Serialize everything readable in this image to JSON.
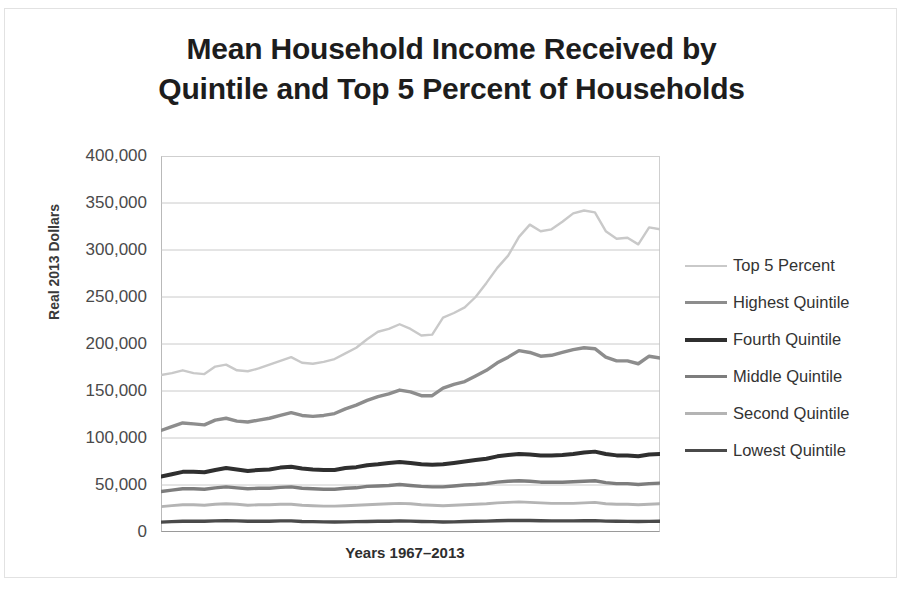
{
  "figure": {
    "title_line1": "Mean Household Income Received by",
    "title_line2": "Quintile and Top 5 Percent of Households",
    "ylabel": "Real 2013 Dollars",
    "xlabel": "Years 1967–2013"
  },
  "axis": {
    "yticks": [
      "400,000",
      "350,000",
      "300,000",
      "250,000",
      "200,000",
      "150,000",
      "100,000",
      "50,000",
      "0"
    ]
  },
  "legend": {
    "items": [
      {
        "label": "Top 5 Percent",
        "color": "#c9c9c9",
        "width": "2.5px"
      },
      {
        "label": "Highest Quintile",
        "color": "#8d8d8d",
        "width": "3.5px"
      },
      {
        "label": "Fourth Quintile",
        "color": "#2f2f2f",
        "width": "4px"
      },
      {
        "label": "Middle Quintile",
        "color": "#7d7d7d",
        "width": "3.5px"
      },
      {
        "label": "Second Quintile",
        "color": "#b4b4b4",
        "width": "3px"
      },
      {
        "label": "Lowest Quintile",
        "color": "#4a4a4a",
        "width": "3.5px"
      }
    ]
  },
  "chart_data": {
    "type": "line",
    "title": "Mean Household Income Received by Quintile and Top 5 Percent of Households",
    "xlabel": "Years 1967–2013",
    "ylabel": "Real 2013 Dollars",
    "ylim": [
      0,
      400000
    ],
    "ytick_step": 50000,
    "grid": true,
    "legend_position": "right",
    "x": [
      1967,
      1968,
      1969,
      1970,
      1971,
      1972,
      1973,
      1974,
      1975,
      1976,
      1977,
      1978,
      1979,
      1980,
      1981,
      1982,
      1983,
      1984,
      1985,
      1986,
      1987,
      1988,
      1989,
      1990,
      1991,
      1992,
      1993,
      1994,
      1995,
      1996,
      1997,
      1998,
      1999,
      2000,
      2001,
      2002,
      2003,
      2004,
      2005,
      2006,
      2007,
      2008,
      2009,
      2010,
      2011,
      2012,
      2013
    ],
    "series": [
      {
        "name": "Top 5 Percent",
        "color": "#c9c9c9",
        "values": [
          167000,
          169000,
          172000,
          169000,
          168000,
          176000,
          178000,
          172000,
          171000,
          174000,
          178000,
          182000,
          186000,
          180000,
          179000,
          181000,
          184000,
          190000,
          196000,
          205000,
          213000,
          216000,
          221000,
          216000,
          209000,
          210000,
          228000,
          233000,
          239000,
          250000,
          265000,
          281000,
          294000,
          314000,
          327000,
          320000,
          322000,
          330000,
          339000,
          342000,
          340000,
          320000,
          312000,
          313000,
          306000,
          324000,
          322000
        ]
      },
      {
        "name": "Highest Quintile",
        "color": "#8d8d8d",
        "values": [
          108000,
          112000,
          116000,
          115000,
          114000,
          119000,
          121000,
          118000,
          117000,
          119000,
          121000,
          124000,
          127000,
          124000,
          123000,
          124000,
          126000,
          131000,
          135000,
          140000,
          144000,
          147000,
          151000,
          149000,
          145000,
          145000,
          153000,
          157000,
          160000,
          166000,
          172000,
          180000,
          186000,
          193000,
          191000,
          187000,
          188000,
          191000,
          194000,
          196000,
          195000,
          186000,
          182000,
          182000,
          179000,
          187000,
          185000
        ]
      },
      {
        "name": "Fourth Quintile",
        "color": "#2f2f2f",
        "values": [
          59000,
          61500,
          64000,
          64000,
          63500,
          66000,
          68000,
          66500,
          65000,
          66000,
          66500,
          68500,
          69500,
          67500,
          66500,
          66000,
          66000,
          68000,
          69000,
          71000,
          72000,
          73500,
          74500,
          73500,
          72000,
          71500,
          72000,
          73500,
          75000,
          76500,
          78000,
          80500,
          82000,
          83000,
          82500,
          81500,
          81500,
          82000,
          83000,
          84500,
          85500,
          83000,
          81500,
          81500,
          80500,
          82500,
          83000
        ]
      },
      {
        "name": "Middle Quintile",
        "color": "#7d7d7d",
        "values": [
          43000,
          44500,
          46000,
          46000,
          45500,
          47000,
          48000,
          47000,
          46000,
          46500,
          46500,
          47500,
          48000,
          46500,
          46000,
          45500,
          45500,
          46500,
          47000,
          48500,
          49000,
          49500,
          50500,
          49500,
          48500,
          48000,
          48000,
          49000,
          50000,
          50500,
          51500,
          53000,
          54000,
          54500,
          54000,
          53000,
          53000,
          53000,
          53500,
          54000,
          54500,
          52500,
          51500,
          51500,
          50500,
          51500,
          52000
        ]
      },
      {
        "name": "Second Quintile",
        "color": "#b4b4b4",
        "values": [
          27000,
          28000,
          29000,
          29000,
          28500,
          29500,
          30000,
          29500,
          28500,
          29000,
          29000,
          29500,
          29500,
          28500,
          28000,
          27500,
          27500,
          28000,
          28500,
          29000,
          29500,
          30000,
          30500,
          30000,
          29000,
          28500,
          28000,
          28500,
          29000,
          29500,
          30000,
          31000,
          31500,
          32000,
          31500,
          31000,
          30500,
          30500,
          30500,
          31000,
          31500,
          30000,
          29500,
          29500,
          29000,
          29500,
          30000
        ]
      },
      {
        "name": "Lowest Quintile",
        "color": "#4a4a4a",
        "values": [
          10500,
          11000,
          11500,
          11500,
          11500,
          11800,
          12000,
          11800,
          11500,
          11500,
          11500,
          11800,
          11800,
          11200,
          11000,
          10800,
          10600,
          10800,
          11000,
          11200,
          11400,
          11500,
          11800,
          11600,
          11200,
          11000,
          10600,
          10800,
          11200,
          11400,
          11600,
          12000,
          12200,
          12400,
          12200,
          11900,
          11800,
          11800,
          11800,
          12000,
          12100,
          11600,
          11400,
          11300,
          11100,
          11300,
          11500
        ]
      }
    ]
  }
}
